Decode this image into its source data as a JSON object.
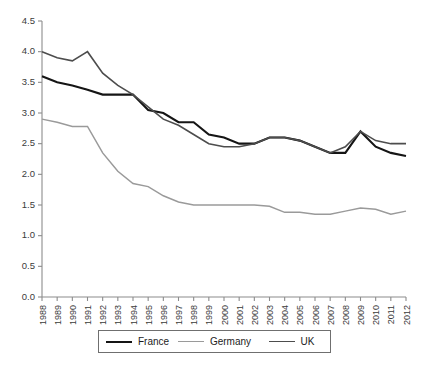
{
  "chart_data": {
    "type": "line",
    "title": "",
    "xlabel": "",
    "ylabel": "",
    "ylim": [
      0.0,
      4.5
    ],
    "ytick_values": [
      0.0,
      0.5,
      1.0,
      1.5,
      2.0,
      2.5,
      3.0,
      3.5,
      4.0,
      4.5
    ],
    "ytick_labels": [
      "0.0",
      "0.5",
      "1.0",
      "1.5",
      "2.0",
      "2.5",
      "3.0",
      "3.5",
      "4.0",
      "4.5"
    ],
    "grid": false,
    "legend_position": "bottom",
    "categories": [
      "1988",
      "1989",
      "1990",
      "1991",
      "1992",
      "1993",
      "1994",
      "1995",
      "1996",
      "1997",
      "1998",
      "1999",
      "2000",
      "2001",
      "2002",
      "2003",
      "2004",
      "2005",
      "2006",
      "2007",
      "2008",
      "2009",
      "2010",
      "2011",
      "2012"
    ],
    "series": [
      {
        "name": "France",
        "color": "#151515",
        "width": 2.1,
        "values": [
          3.6,
          3.5,
          3.45,
          3.38,
          3.3,
          3.3,
          3.3,
          3.05,
          3.0,
          2.85,
          2.85,
          2.65,
          2.6,
          2.5,
          2.5,
          2.6,
          2.6,
          2.55,
          2.45,
          2.35,
          2.35,
          2.7,
          2.45,
          2.35,
          2.3
        ]
      },
      {
        "name": "Germany",
        "color": "#9a9a9a",
        "width": 1.5,
        "values": [
          2.9,
          2.85,
          2.78,
          2.78,
          2.35,
          2.05,
          1.85,
          1.8,
          1.65,
          1.55,
          1.5,
          1.5,
          1.5,
          1.5,
          1.5,
          1.48,
          1.38,
          1.38,
          1.35,
          1.35,
          1.4,
          1.45,
          1.43,
          1.35,
          1.4
        ]
      },
      {
        "name": "UK",
        "color": "#4d4d4d",
        "width": 1.6,
        "values": [
          4.0,
          3.9,
          3.85,
          4.0,
          3.65,
          3.45,
          3.3,
          3.1,
          2.9,
          2.8,
          2.65,
          2.5,
          2.45,
          2.45,
          2.5,
          2.6,
          2.6,
          2.55,
          2.45,
          2.35,
          2.45,
          2.7,
          2.55,
          2.5,
          2.5
        ]
      }
    ]
  },
  "legend": {
    "items": [
      {
        "label": "France"
      },
      {
        "label": "Germany"
      },
      {
        "label": "UK"
      }
    ]
  }
}
